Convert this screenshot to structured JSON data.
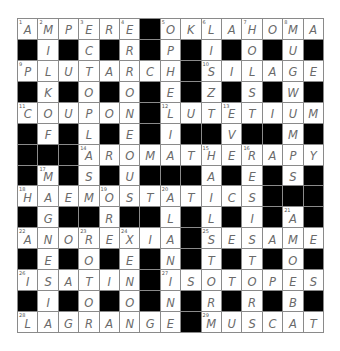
{
  "puzzle": {
    "rows": 15,
    "cols": 15,
    "grid": [
      "AMPERE#OKLAHOMA",
      "#I#C#R#P#I#O#U#",
      "PLUTARCH#SILAGE",
      "#K#O#O#E#Z#S#W#",
      "COUPON#LUTETIUM",
      "#F#L#E#I##V##M#",
      "###AROMATHERAPY",
      "#M#S#U###A#E#S#",
      "HAEMOSTATICS###",
      "#G##R##L#L#I#A#",
      "ANOREXIA#SESAME",
      "#E#O#E#N#T#T#O#",
      "ISATIN#ISOTOPES",
      "#I#O#O#N#R#R#B#",
      "LAGRANGE#MUSCAT"
    ],
    "numbers": [
      {
        "n": 1,
        "r": 0,
        "c": 0
      },
      {
        "n": 2,
        "r": 0,
        "c": 1
      },
      {
        "n": 3,
        "r": 0,
        "c": 3
      },
      {
        "n": 4,
        "r": 0,
        "c": 5
      },
      {
        "n": 5,
        "r": 0,
        "c": 7
      },
      {
        "n": 6,
        "r": 0,
        "c": 9
      },
      {
        "n": 7,
        "r": 0,
        "c": 11
      },
      {
        "n": 8,
        "r": 0,
        "c": 13
      },
      {
        "n": 9,
        "r": 2,
        "c": 0
      },
      {
        "n": 10,
        "r": 2,
        "c": 9
      },
      {
        "n": 11,
        "r": 4,
        "c": 0
      },
      {
        "n": 12,
        "r": 4,
        "c": 7
      },
      {
        "n": 13,
        "r": 4,
        "c": 10
      },
      {
        "n": 14,
        "r": 6,
        "c": 3
      },
      {
        "n": 15,
        "r": 6,
        "c": 9
      },
      {
        "n": 16,
        "r": 6,
        "c": 11
      },
      {
        "n": 17,
        "r": 7,
        "c": 1
      },
      {
        "n": 18,
        "r": 8,
        "c": 0
      },
      {
        "n": 19,
        "r": 8,
        "c": 4
      },
      {
        "n": 20,
        "r": 8,
        "c": 7
      },
      {
        "n": 21,
        "r": 9,
        "c": 13
      },
      {
        "n": 22,
        "r": 10,
        "c": 0
      },
      {
        "n": 23,
        "r": 10,
        "c": 3
      },
      {
        "n": 24,
        "r": 10,
        "c": 5
      },
      {
        "n": 25,
        "r": 10,
        "c": 9
      },
      {
        "n": 26,
        "r": 12,
        "c": 0
      },
      {
        "n": 27,
        "r": 12,
        "c": 7
      },
      {
        "n": 28,
        "r": 14,
        "c": 0
      },
      {
        "n": 29,
        "r": 14,
        "c": 9
      }
    ],
    "answers_across": [
      {
        "n": 1,
        "answer": "AMPERE"
      },
      {
        "n": 5,
        "answer": "OKLAHOMA"
      },
      {
        "n": 9,
        "answer": "PLUTARCH"
      },
      {
        "n": 10,
        "answer": "SILAGE"
      },
      {
        "n": 11,
        "answer": "COUPON"
      },
      {
        "n": 12,
        "answer": "LUTETIUM"
      },
      {
        "n": 14,
        "answer": "AROMATHERAPY"
      },
      {
        "n": 18,
        "answer": "HAEMOSTATICS"
      },
      {
        "n": 22,
        "answer": "ANOREXIA"
      },
      {
        "n": 25,
        "answer": "SESAME"
      },
      {
        "n": 26,
        "answer": "ISATIN"
      },
      {
        "n": 27,
        "answer": "ISOTOPES"
      },
      {
        "n": 28,
        "answer": "LAGRANGE"
      },
      {
        "n": 29,
        "answer": "MUSCAT"
      }
    ],
    "colors": {
      "background": "#ffffff",
      "block": "#000000",
      "gridline": "#8a8a8a",
      "letter": "#6a6a6a",
      "number": "#555555"
    }
  }
}
